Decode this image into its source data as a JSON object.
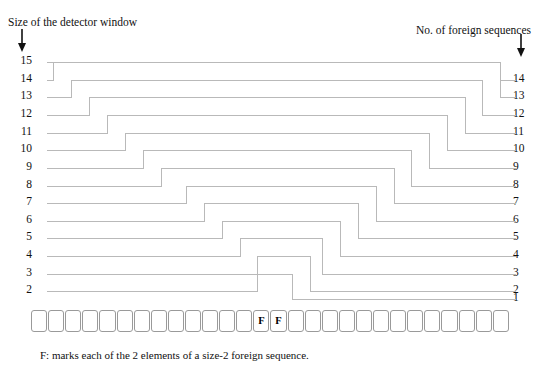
{
  "figure": {
    "header_left": "Size of the detector window",
    "header_right": "No. of foreign sequences",
    "caption": "F: marks each of the 2 elements of a size-2 foreign sequence.",
    "left_axis_title_arrow": "down-arrow",
    "right_axis_title_arrow": "down-arrow",
    "left_axis_labels": [
      "15",
      "14",
      "13",
      "12",
      "11",
      "10",
      "9",
      "8",
      "7",
      "6",
      "5",
      "4",
      "3",
      "2"
    ],
    "right_axis_labels": [
      "14",
      "13",
      "12",
      "11",
      "10",
      "9",
      "8",
      "7",
      "6",
      "5",
      "4",
      "3",
      "2",
      "1"
    ],
    "foreign_marker": "F",
    "foreign_marker_cells": [
      13,
      14
    ],
    "total_cells": 28,
    "line_color": "#b9b9b9",
    "cell_border_color": "#9a9a9a",
    "text_color": "#111111"
  },
  "chart_data": {
    "type": "line",
    "xlabel": "",
    "ylabel": "",
    "grid": false,
    "legend": null,
    "series": [
      {
        "name": "window-15",
        "left_level": 15,
        "right_level": 14,
        "rise_x": 47,
        "fall_x": 500,
        "plateau_level": 15
      },
      {
        "name": "window-14",
        "left_level": 14,
        "right_level": 13,
        "rise_x": 53,
        "fall_x": 500,
        "plateau_level": 15
      },
      {
        "name": "window-13",
        "left_level": 13,
        "right_level": 12,
        "rise_x": 71,
        "fall_x": 482,
        "plateau_level": 14
      },
      {
        "name": "window-12",
        "left_level": 12,
        "right_level": 11,
        "rise_x": 89,
        "fall_x": 465,
        "plateau_level": 13
      },
      {
        "name": "window-11",
        "left_level": 11,
        "right_level": 10,
        "rise_x": 107,
        "fall_x": 447,
        "plateau_level": 12
      },
      {
        "name": "window-10",
        "left_level": 10,
        "right_level": 9,
        "rise_x": 125,
        "fall_x": 429,
        "plateau_level": 11
      },
      {
        "name": "window-9",
        "left_level": 9,
        "right_level": 8,
        "rise_x": 143,
        "fall_x": 411,
        "plateau_level": 10
      },
      {
        "name": "window-8",
        "left_level": 8,
        "right_level": 7,
        "rise_x": 161,
        "fall_x": 394,
        "plateau_level": 9
      },
      {
        "name": "window-7",
        "left_level": 7,
        "right_level": 6,
        "rise_x": 186,
        "fall_x": 376,
        "plateau_level": 8
      },
      {
        "name": "window-6",
        "left_level": 6,
        "right_level": 5,
        "rise_x": 204,
        "fall_x": 358,
        "plateau_level": 7
      },
      {
        "name": "window-5",
        "left_level": 5,
        "right_level": 4,
        "rise_x": 222,
        "fall_x": 340,
        "plateau_level": 6
      },
      {
        "name": "window-4",
        "left_level": 4,
        "right_level": 3,
        "rise_x": 240,
        "fall_x": 322,
        "plateau_level": 5
      },
      {
        "name": "window-3",
        "left_level": 3,
        "right_level": 2,
        "rise_x": 257,
        "fall_x": 310,
        "plateau_level": 4
      },
      {
        "name": "window-2",
        "left_level": 2,
        "right_level": 1,
        "rise_x": 257,
        "fall_x": 292,
        "plateau_level": 3
      }
    ],
    "row_y": {
      "1": 299,
      "2": 291,
      "3": 274,
      "4": 256,
      "5": 238,
      "6": 221,
      "7": 203,
      "8": 186,
      "9": 168,
      "10": 150,
      "11": 133,
      "12": 115,
      "13": 97,
      "14": 80,
      "15": 62
    },
    "x_start": 47,
    "x_end": 516
  }
}
